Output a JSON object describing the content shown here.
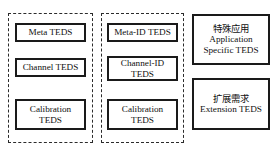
{
  "diagram": {
    "background_color": "#ffffff",
    "border_color": "#1a1a1a",
    "group_border_color": "#2b2b2b",
    "text_color": "#111111",
    "groups": [
      {
        "name": "left-teds-group"
      },
      {
        "name": "middle-teds-group"
      }
    ],
    "columns": {
      "left": {
        "boxes": [
          {
            "line1": "Meta TEDS"
          },
          {
            "line1": "Channel TEDS"
          },
          {
            "line1": "Calibration",
            "line2": "TEDS"
          }
        ]
      },
      "middle": {
        "boxes": [
          {
            "line1": "Meta-ID TEDS"
          },
          {
            "line1": "Channel-ID",
            "line2": "TEDS"
          },
          {
            "line1": "Calibration",
            "line2": "TEDS"
          }
        ]
      },
      "right": {
        "boxes": [
          {
            "line1": "特殊应用",
            "line2": "Application",
            "line3": "Specific TEDS"
          },
          {
            "line1": "扩展需求",
            "line2": "Extension TEDS"
          }
        ]
      }
    }
  }
}
